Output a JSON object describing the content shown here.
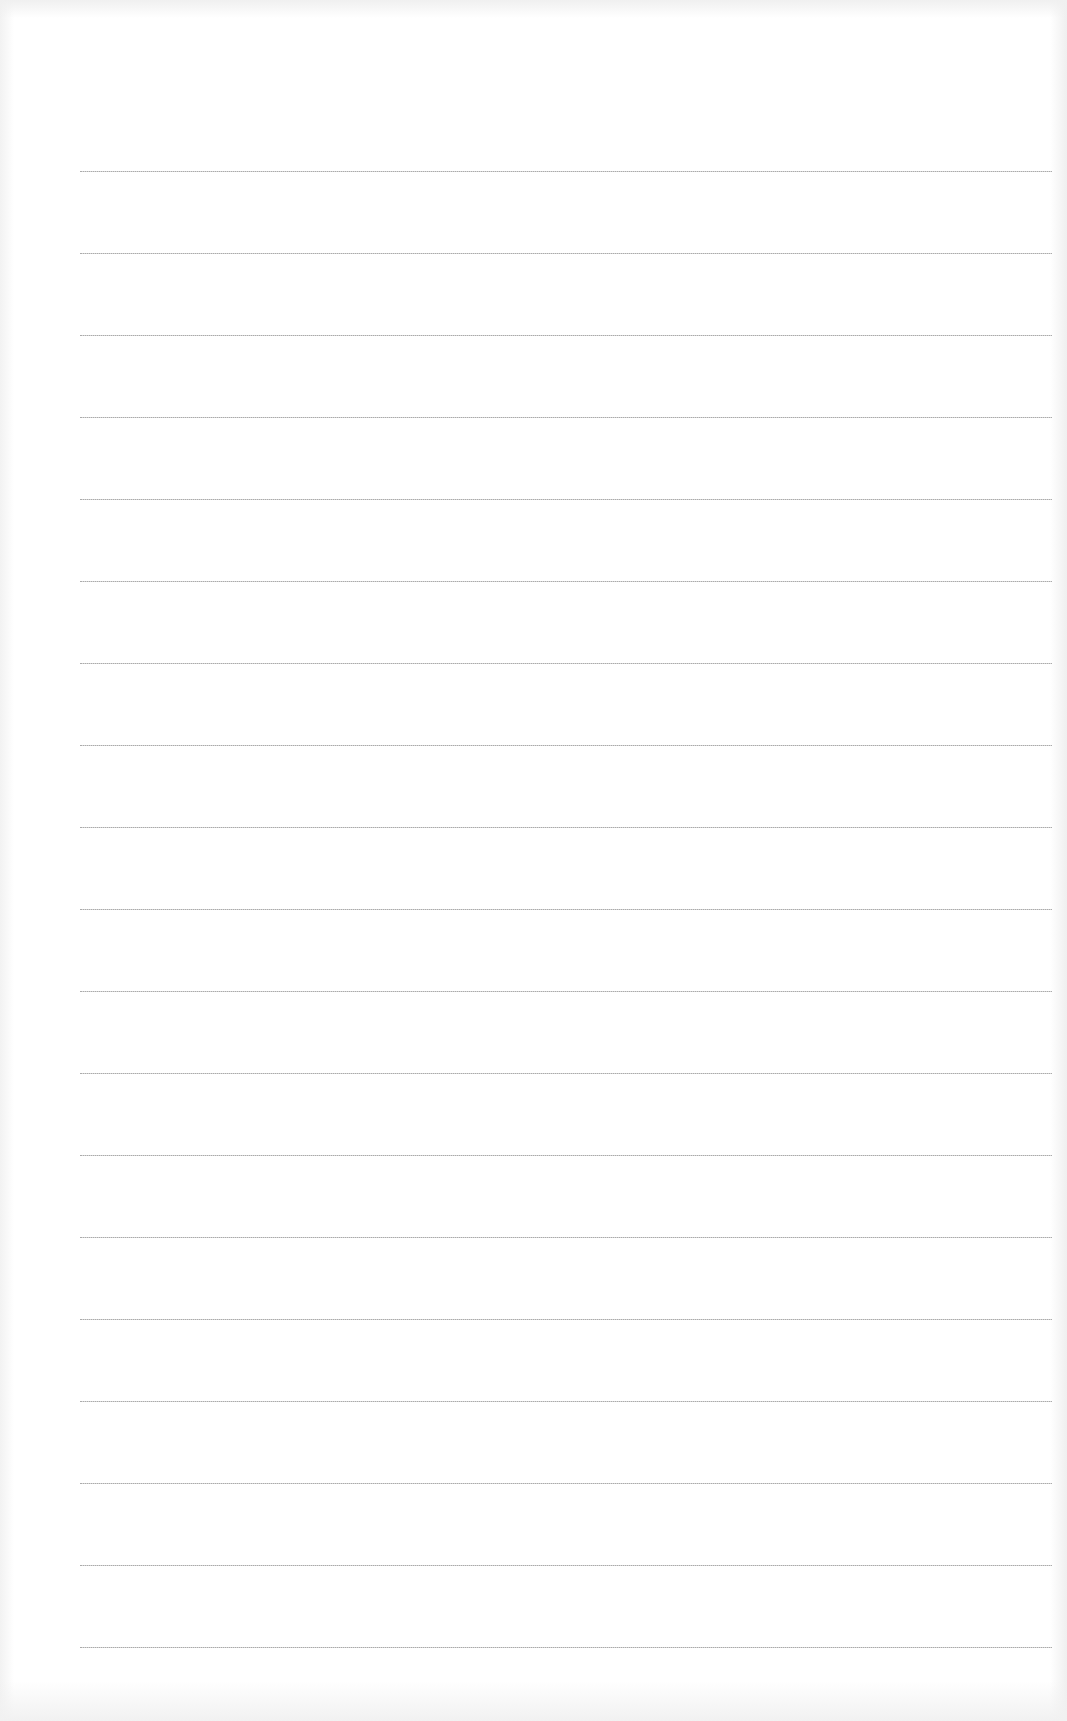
{
  "page": {
    "type": "lined-paper",
    "background_color": "#ffffff",
    "line_color": "#9a9a9a",
    "line_count": 19,
    "line_left_px": 80,
    "line_right_px": 1052,
    "first_line_y_px": 171,
    "line_spacing_px": 82,
    "text": ""
  }
}
